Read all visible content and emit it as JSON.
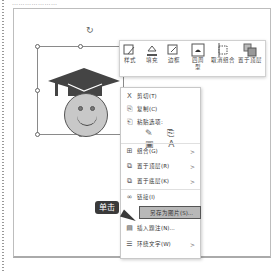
{
  "caption": "…………………",
  "toolbar": {
    "buttons": [
      {
        "label": "样式",
        "icon": "style-icon"
      },
      {
        "label": "填充",
        "icon": "fill-icon"
      },
      {
        "label": "边框",
        "icon": "border-icon"
      },
      {
        "label": "四周型",
        "icon": "wrap-square-icon"
      },
      {
        "label": "取消组合",
        "icon": "ungroup-icon"
      },
      {
        "label": "置于顶层",
        "icon": "bring-to-front-icon"
      }
    ]
  },
  "context_menu": {
    "items": [
      {
        "label": "剪切(T)",
        "icon": "X"
      },
      {
        "label": "复制(C)",
        "icon": "⎘"
      },
      {
        "label": "粘贴选项:",
        "icon": "📋"
      },
      {
        "label": "组合(G)",
        "icon": "⊞",
        "submenu": true
      },
      {
        "label": "置于顶层(R)",
        "icon": "⧉",
        "submenu": true
      },
      {
        "label": "置于底层(K)",
        "icon": "⧉",
        "submenu": true
      },
      {
        "label": "链接(I)",
        "icon": "∞"
      },
      {
        "label": "另存为图片(S)...",
        "icon": "",
        "highlighted": true
      },
      {
        "label": "插入题注(N)...",
        "icon": "▤"
      },
      {
        "label": "环绕文字(W)",
        "icon": "☰",
        "submenu": true
      }
    ],
    "paste_options": "✎ ⎘ ▣ A"
  },
  "callout": {
    "label": "单击"
  },
  "colors": {
    "highlight": "#b8b8b8",
    "callout_bg": "#3a3a3a",
    "hat": "#444444",
    "face": "#c8c8c8"
  }
}
